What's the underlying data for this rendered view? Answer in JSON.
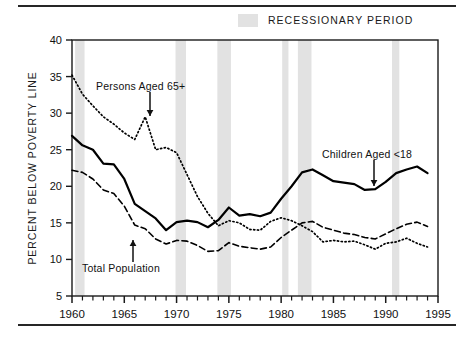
{
  "legend": {
    "label": "RECESSIONARY PERIOD",
    "swatch_color": "#e2e2e2"
  },
  "axis": {
    "ylabel": "PERCENT BELOW POVERTY LINE",
    "y_ticks": [
      "40",
      "35",
      "30",
      "25",
      "20",
      "15",
      "10",
      "5"
    ],
    "x_ticks": [
      "1960",
      "1965",
      "1970",
      "1975",
      "1980",
      "1985",
      "1990",
      "1995"
    ]
  },
  "annotations": [
    {
      "id": "elderly",
      "text": "Persons Aged 65+"
    },
    {
      "id": "children",
      "text": "Children Aged <18"
    },
    {
      "id": "total",
      "text": "Total Population"
    }
  ],
  "chart_data": {
    "type": "line",
    "title": "",
    "xlabel": "",
    "ylabel": "PERCENT BELOW POVERTY LINE",
    "xlim": [
      1960,
      1995
    ],
    "ylim": [
      5,
      40
    ],
    "grid": false,
    "legend_position": "top-right",
    "x": [
      1960,
      1961,
      1962,
      1963,
      1964,
      1965,
      1966,
      1967,
      1968,
      1969,
      1970,
      1971,
      1972,
      1973,
      1974,
      1975,
      1976,
      1977,
      1978,
      1979,
      1980,
      1981,
      1982,
      1983,
      1984,
      1985,
      1986,
      1987,
      1988,
      1989,
      1990,
      1991,
      1992,
      1993,
      1994
    ],
    "series": [
      {
        "name": "Children Aged <18",
        "style": "solid",
        "color": "#000000",
        "values": [
          26.9,
          25.6,
          25.0,
          23.1,
          23.0,
          21.0,
          17.6,
          16.6,
          15.6,
          14.0,
          15.1,
          15.3,
          15.1,
          14.4,
          15.4,
          17.1,
          16.0,
          16.2,
          15.9,
          16.4,
          18.3,
          20.0,
          21.9,
          22.3,
          21.5,
          20.7,
          20.5,
          20.3,
          19.5,
          19.6,
          20.6,
          21.8,
          22.3,
          22.7,
          21.8
        ]
      },
      {
        "name": "Persons Aged 65+",
        "style": "dotted",
        "color": "#000000",
        "values": [
          35.2,
          32.6,
          31.0,
          29.5,
          28.5,
          27.3,
          26.4,
          29.5,
          25.0,
          25.3,
          24.6,
          21.6,
          18.6,
          16.3,
          14.6,
          15.3,
          15.0,
          14.1,
          14.0,
          15.2,
          15.7,
          15.3,
          14.6,
          13.8,
          12.4,
          12.6,
          12.4,
          12.5,
          12.0,
          11.4,
          12.2,
          12.4,
          12.9,
          12.2,
          11.7
        ]
      },
      {
        "name": "Total Population",
        "style": "dashed",
        "color": "#000000",
        "values": [
          22.2,
          21.9,
          21.0,
          19.5,
          19.0,
          17.3,
          14.7,
          14.2,
          12.8,
          12.1,
          12.6,
          12.5,
          11.9,
          11.1,
          11.2,
          12.3,
          11.8,
          11.6,
          11.4,
          11.7,
          13.0,
          14.0,
          15.0,
          15.2,
          14.4,
          14.0,
          13.6,
          13.4,
          13.0,
          12.8,
          13.5,
          14.2,
          14.8,
          15.1,
          14.5
        ]
      }
    ],
    "recession_bands": [
      {
        "start": 1960.3,
        "end": 1961.2
      },
      {
        "start": 1969.9,
        "end": 1970.9
      },
      {
        "start": 1973.9,
        "end": 1975.2
      },
      {
        "start": 1980.1,
        "end": 1980.7
      },
      {
        "start": 1981.6,
        "end": 1982.9
      },
      {
        "start": 1990.6,
        "end": 1991.3
      }
    ]
  }
}
